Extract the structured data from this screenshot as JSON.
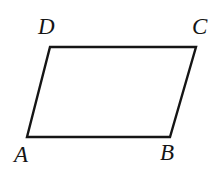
{
  "figure": {
    "type": "geometry-diagram",
    "shape": "parallelogram",
    "background_color": "#ffffff",
    "stroke_color": "#151515",
    "stroke_width": 2.4,
    "canvas": {
      "width": 218,
      "height": 172
    },
    "vertices": [
      {
        "id": "A",
        "label": "A",
        "x": 27,
        "y": 137,
        "label_x": 14,
        "label_y": 143
      },
      {
        "id": "B",
        "label": "B",
        "x": 170,
        "y": 137,
        "label_x": 160,
        "label_y": 141
      },
      {
        "id": "C",
        "label": "C",
        "x": 196,
        "y": 47,
        "label_x": 192,
        "label_y": 15
      },
      {
        "id": "D",
        "label": "D",
        "x": 50,
        "y": 47,
        "label_x": 38,
        "label_y": 15
      }
    ],
    "edges": [
      {
        "id": "AB",
        "from": "A",
        "to": "B"
      },
      {
        "id": "BC",
        "from": "B",
        "to": "C"
      },
      {
        "id": "CD",
        "from": "C",
        "to": "D"
      },
      {
        "id": "DA",
        "from": "D",
        "to": "A"
      }
    ],
    "path": "M 27 137 L 170 137 L 196 47 L 50 47 Z",
    "labels": {
      "A": "A",
      "B": "B",
      "C": "C",
      "D": "D"
    }
  }
}
